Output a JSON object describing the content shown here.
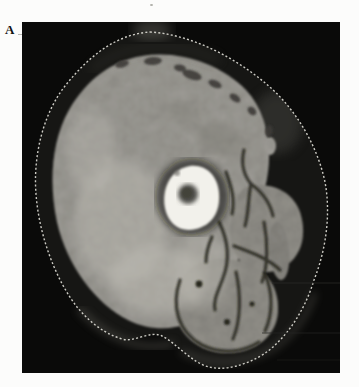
{
  "figure": {
    "panel_label": "A",
    "alt": "Axial CT slice of the thigh on a black background: large mottled gray anterior muscle compartment, femur with bright white cortex and dark central marrow cavity, darker posterior and medial muscle groups separated by dark intermuscular septa and vessels, a dark subcutaneous fat ring, and a thin dotted skin outline"
  },
  "colors": {
    "page-bg": "#fcfcfb",
    "frame-bg": "#0a0a09",
    "fat": "#161614",
    "fat-haze": "#4a4944",
    "muscle": "#a8a6a0",
    "muscle-bright": "#bcbab2",
    "posterior-muscle": "#98968f",
    "distal-muscle": "#8e8c86",
    "bone": "#f2f1eb",
    "marrow": "#4e4d48",
    "skin-line": "#d7d6cf",
    "septa": "#26251f",
    "spot-dark": "#3c3b37",
    "label-text": "#131313",
    "artifact": "#9a9a94"
  }
}
